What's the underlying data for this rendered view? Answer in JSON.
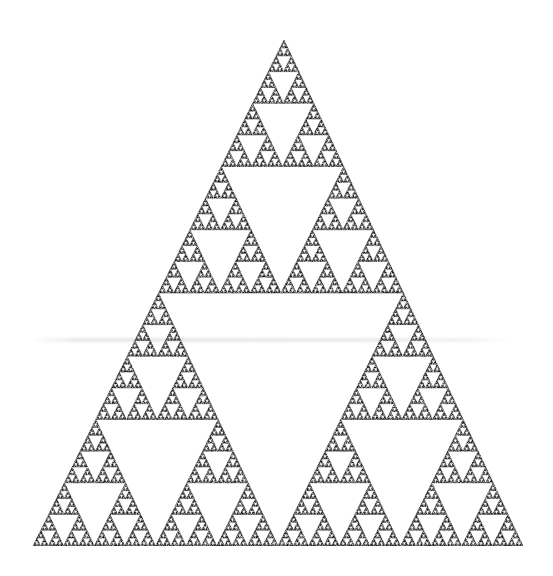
{
  "image": {
    "subject": "Sierpinski triangle",
    "background_color": "#ffffff",
    "ink_color": "#1a1a1a",
    "apex": [
      284,
      40
    ],
    "base_left": [
      33,
      546
    ],
    "base_right": [
      523,
      546
    ],
    "recursion_depth": 7,
    "has_faint_scanline": true
  }
}
